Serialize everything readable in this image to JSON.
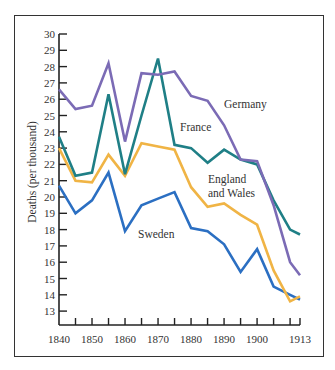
{
  "chart_data": {
    "type": "line",
    "title": "",
    "xlabel": "",
    "ylabel": "Deaths (per thousand)",
    "xlim": [
      1840,
      1913
    ],
    "ylim": [
      12.2,
      30
    ],
    "grid": false,
    "legend_position": "inline labels",
    "x_ticks": [
      1840,
      1850,
      1860,
      1870,
      1880,
      1890,
      1900,
      1913
    ],
    "x_minor_ticks": [
      1845,
      1850,
      1855,
      1860,
      1865,
      1870,
      1875,
      1880,
      1885,
      1890,
      1895,
      1900,
      1905,
      1910,
      1913
    ],
    "y_ticks": [
      13,
      14,
      15,
      16,
      17,
      18,
      19,
      20,
      21,
      22,
      23,
      24,
      25,
      26,
      27,
      28,
      29,
      30
    ],
    "x": [
      1840,
      1845,
      1850,
      1855,
      1860,
      1865,
      1870,
      1875,
      1880,
      1885,
      1890,
      1895,
      1900,
      1905,
      1910,
      1913
    ],
    "series": [
      {
        "name": "Germany",
        "color": "#7b6bb5",
        "label_pos": [
          1888,
          25.4
        ],
        "values": [
          26.6,
          25.4,
          25.6,
          28.2,
          23.4,
          27.6,
          27.5,
          27.7,
          26.2,
          25.9,
          24.4,
          22.3,
          22.2,
          19.5,
          16.0,
          15.2
        ]
      },
      {
        "name": "France",
        "color": "#1f7f86",
        "label_pos": [
          1867,
          24.2
        ],
        "values": [
          23.7,
          21.3,
          21.5,
          26.3,
          21.4,
          25.0,
          28.5,
          23.2,
          23.0,
          22.1,
          22.9,
          22.3,
          22.0,
          19.8,
          18.0,
          17.7
        ]
      },
      {
        "name": "England and Wales",
        "color": "#f0b445",
        "label_pos": [
          1880,
          21.7
        ],
        "values": [
          23.0,
          21.0,
          20.9,
          22.6,
          21.3,
          23.3,
          23.1,
          22.9,
          20.6,
          19.4,
          19.6,
          18.9,
          18.3,
          15.5,
          13.6,
          13.9
        ]
      },
      {
        "name": "Sweden",
        "color": "#2b6fc2",
        "label_pos": [
          1862,
          18.2
        ],
        "values": [
          20.7,
          19.0,
          19.8,
          21.5,
          17.9,
          19.5,
          19.9,
          20.3,
          18.1,
          17.9,
          17.1,
          15.4,
          16.8,
          14.5,
          14.0,
          13.7
        ]
      }
    ]
  },
  "labels": {
    "germany": "Germany",
    "france": "France",
    "england_line1": "England",
    "england_line2": "and Wales",
    "sweden": "Sweden",
    "ylabel": "Deaths (per thousand)"
  }
}
